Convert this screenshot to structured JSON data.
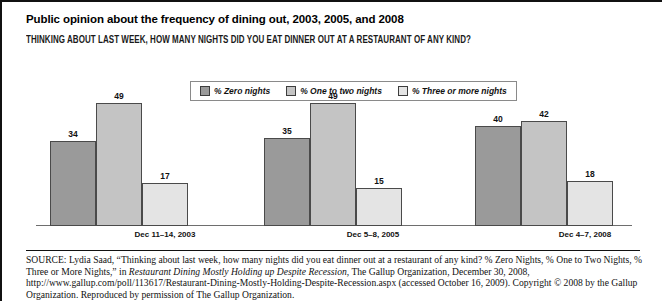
{
  "header": {
    "title": "Public opinion about the frequency of dining out, 2003, 2005, and 2008",
    "subtitle": "THINKING ABOUT LAST WEEK, HOW MANY NIGHTS DID YOU EAT DINNER OUT AT A RESTAURANT OF ANY KIND?"
  },
  "legend": {
    "items": [
      {
        "label": "% Zero nights",
        "color": "#9a9a9a"
      },
      {
        "label": "% One to two nights",
        "color": "#c4c4c4"
      },
      {
        "label": "% Three or more nights",
        "color": "#e4e4e4"
      }
    ]
  },
  "source": {
    "label": "SOURCE:",
    "text_1": " Lydia Saad, “Thinking about last week, how many nights did you eat dinner out at a restaurant of any kind? % Zero Nights, % One to Two Nights, % Three or More Nights,” in ",
    "italic_title": "Restaurant Dining Mostly Holding up Despite Recession",
    "text_2": ", The Gallup Organization, December 30, 2008, http://www.gallup.com/poll/113617/Restaurant-Dining-Mostly-Holding-Despite-Recession.aspx (accessed October 16, 2009). Copyright © 2008 by the Gallup Organization. Reproduced by permission of The Gallup Organization."
  },
  "chart_data": {
    "type": "bar",
    "title": "Public opinion about the frequency of dining out, 2003, 2005, and 2008",
    "subtitle": "THINKING ABOUT LAST WEEK, HOW MANY NIGHTS DID YOU EAT DINNER OUT AT A RESTAURANT OF ANY KIND?",
    "categories": [
      "Dec 11–14, 2003",
      "Dec 5–8, 2005",
      "Dec 4–7, 2008"
    ],
    "series": [
      {
        "name": "% Zero nights",
        "values": [
          34,
          35,
          40
        ],
        "color": "#9a9a9a"
      },
      {
        "name": "% One to two nights",
        "values": [
          49,
          49,
          42
        ],
        "color": "#c4c4c4"
      },
      {
        "name": "% Three or more nights",
        "values": [
          17,
          15,
          18
        ],
        "color": "#e4e4e4"
      }
    ],
    "xlabel": "",
    "ylabel": "",
    "ylim": [
      0,
      60
    ],
    "grid": false,
    "legend_position": "top-center",
    "value_labels": true
  }
}
